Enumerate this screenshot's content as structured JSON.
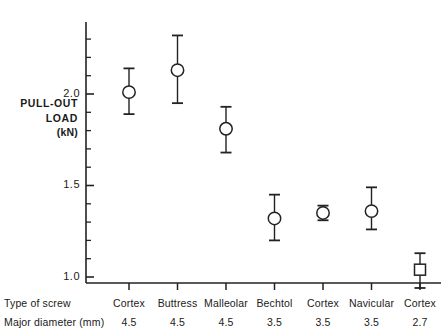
{
  "chart_data": {
    "type": "scatter",
    "title": "",
    "xlabel": "",
    "ylabel": "PULL-OUT LOAD (kN)",
    "ylabel_lines": [
      "PULL-OUT",
      "LOAD",
      "(kN)"
    ],
    "ylim": [
      0.9,
      2.4
    ],
    "ytick_labels": [
      "2.0",
      "1.5",
      "1.0"
    ],
    "ytick_values": [
      2.0,
      1.5,
      1.0
    ],
    "y_minor_tick_step": 0.1,
    "grid": false,
    "legend": null,
    "row_headings": [
      "Type of screw",
      "Major diameter (mm)"
    ],
    "categories": [
      "Cortex 4.5",
      "Buttress 4.5",
      "Malleolar 4.5",
      "Bechtol 3.5",
      "Cortex 3.5",
      "Navicular 3.5",
      "Cortex 2.7"
    ],
    "screw_types": [
      "Cortex",
      "Buttress",
      "Malleolar",
      "Bechtol",
      "Cortex",
      "Navicular",
      "Cortex"
    ],
    "major_diameters": [
      "4.5",
      "4.5",
      "4.5",
      "3.5",
      "3.5",
      "3.5",
      "2.7"
    ],
    "values": [
      2.01,
      2.13,
      1.81,
      1.32,
      1.35,
      1.36,
      1.04
    ],
    "error_upper": [
      2.14,
      2.32,
      1.93,
      1.45,
      1.39,
      1.49,
      1.13
    ],
    "error_lower": [
      1.89,
      1.95,
      1.68,
      1.2,
      1.31,
      1.26,
      0.94
    ],
    "markers": [
      "circle",
      "circle",
      "circle",
      "circle",
      "circle",
      "circle",
      "square"
    ],
    "points": [
      {
        "category": "Cortex 4.5",
        "screw": "Cortex",
        "diameter": "4.5",
        "mean": 2.01,
        "high": 2.14,
        "low": 1.89,
        "marker": "circle"
      },
      {
        "category": "Buttress 4.5",
        "screw": "Buttress",
        "diameter": "4.5",
        "mean": 2.13,
        "high": 2.32,
        "low": 1.95,
        "marker": "circle"
      },
      {
        "category": "Malleolar 4.5",
        "screw": "Malleolar",
        "diameter": "4.5",
        "mean": 1.81,
        "high": 1.93,
        "low": 1.68,
        "marker": "circle"
      },
      {
        "category": "Bechtol 3.5",
        "screw": "Bechtol",
        "diameter": "3.5",
        "mean": 1.32,
        "high": 1.45,
        "low": 1.2,
        "marker": "circle"
      },
      {
        "category": "Cortex 3.5",
        "screw": "Cortex",
        "diameter": "3.5",
        "mean": 1.35,
        "high": 1.39,
        "low": 1.31,
        "marker": "circle"
      },
      {
        "category": "Navicular 3.5",
        "screw": "Navicular",
        "diameter": "3.5",
        "mean": 1.36,
        "high": 1.49,
        "low": 1.26,
        "marker": "circle"
      },
      {
        "category": "Cortex 2.7",
        "screw": "Cortex",
        "diameter": "2.7",
        "mean": 1.04,
        "high": 1.13,
        "low": 0.94,
        "marker": "square"
      }
    ],
    "colors": {
      "axis": "#222222",
      "marker_stroke": "#222222",
      "marker_fill": "#ffffff",
      "background": "#ffffff"
    }
  }
}
